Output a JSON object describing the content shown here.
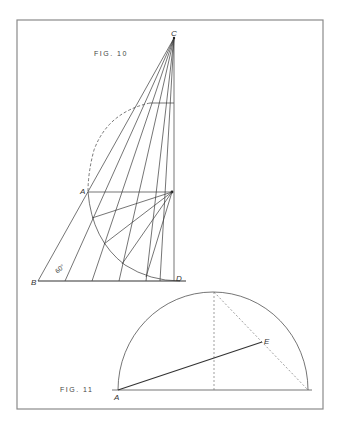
{
  "figures": [
    {
      "id": "fig10",
      "label": "FIG. 10",
      "points": {
        "C": "C",
        "A": "A",
        "B": "B",
        "D": "D"
      },
      "angle_label": "60°"
    },
    {
      "id": "fig11",
      "label": "FIG. 11",
      "points": {
        "A": "A",
        "E": "E"
      }
    }
  ],
  "colors": {
    "background": "#ffffff",
    "frame": "#8a8a8a",
    "line": "#3a3a3a"
  }
}
